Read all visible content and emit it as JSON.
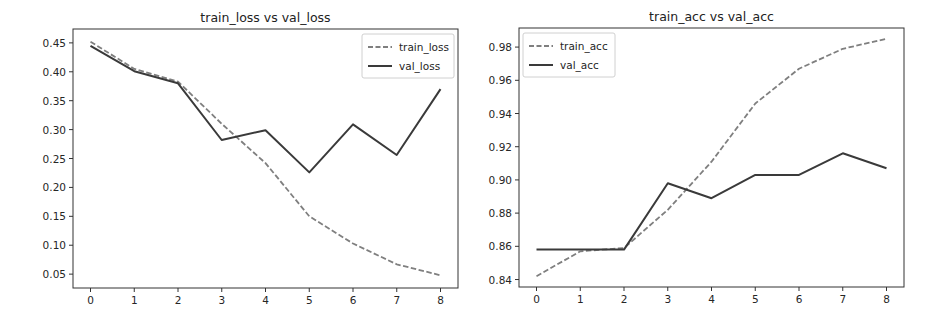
{
  "chart_data": [
    {
      "type": "line",
      "title": "train_loss vs val_loss",
      "xlabel": "",
      "ylabel": "",
      "x": [
        0,
        1,
        2,
        3,
        4,
        5,
        6,
        7,
        8
      ],
      "xticks": [
        "0",
        "1",
        "2",
        "3",
        "4",
        "5",
        "6",
        "7",
        "8"
      ],
      "yticks": [
        "0.05",
        "0.10",
        "0.15",
        "0.20",
        "0.25",
        "0.30",
        "0.35",
        "0.40",
        "0.45"
      ],
      "ylim": [
        0.026,
        0.474
      ],
      "xlim": [
        -0.4,
        8.4
      ],
      "grid": false,
      "legend_position": "upper right",
      "series": [
        {
          "name": "train_loss",
          "style": "dashed",
          "color": "#7f7f7f",
          "values": [
            0.452,
            0.405,
            0.383,
            0.31,
            0.242,
            0.15,
            0.103,
            0.067,
            0.048
          ]
        },
        {
          "name": "val_loss",
          "style": "solid",
          "color": "#3a3a3a",
          "values": [
            0.445,
            0.401,
            0.38,
            0.282,
            0.299,
            0.226,
            0.309,
            0.256,
            0.37
          ]
        }
      ]
    },
    {
      "type": "line",
      "title": "train_acc vs val_acc",
      "xlabel": "",
      "ylabel": "",
      "x": [
        0,
        1,
        2,
        3,
        4,
        5,
        6,
        7,
        8
      ],
      "xticks": [
        "0",
        "1",
        "2",
        "3",
        "4",
        "5",
        "6",
        "7",
        "8"
      ],
      "yticks": [
        "0.84",
        "0.86",
        "0.88",
        "0.90",
        "0.92",
        "0.94",
        "0.96",
        "0.98"
      ],
      "ylim": [
        0.8355,
        0.9915
      ],
      "xlim": [
        -0.4,
        8.4
      ],
      "grid": false,
      "legend_position": "upper left",
      "series": [
        {
          "name": "train_acc",
          "style": "dashed",
          "color": "#7f7f7f",
          "values": [
            0.842,
            0.857,
            0.859,
            0.882,
            0.911,
            0.946,
            0.967,
            0.979,
            0.985
          ]
        },
        {
          "name": "val_acc",
          "style": "solid",
          "color": "#3a3a3a",
          "values": [
            0.858,
            0.858,
            0.858,
            0.898,
            0.889,
            0.903,
            0.903,
            0.916,
            0.907
          ]
        }
      ]
    }
  ]
}
